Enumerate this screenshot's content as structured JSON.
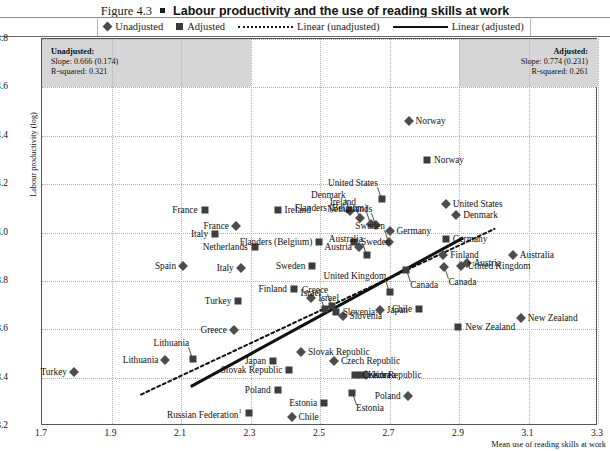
{
  "figure": {
    "number": "Figure 4.3",
    "bullet": "square-bullet",
    "title": "Labour productivity and the use of reading skills at work"
  },
  "legend": {
    "position": "top-center",
    "items": [
      {
        "marker": "diamond-marker",
        "label": "Unadjusted"
      },
      {
        "marker": "square-marker",
        "label": "Adjusted"
      },
      {
        "marker": "dotted-line",
        "label": "Linear (unadjusted)"
      },
      {
        "marker": "solid-line",
        "label": "Linear (adjusted)"
      }
    ]
  },
  "annotations": {
    "left": {
      "heading": "Unadjusted:",
      "slope": "Slope: 0.666 (0.174)",
      "r_squared": "R-squared: 0.321"
    },
    "right": {
      "heading": "Adjusted:",
      "slope": "Slope: 0.774 (0.231)",
      "r_squared": "R-squared: 0.261"
    }
  },
  "chart_data": {
    "type": "scatter",
    "title": "Labour productivity and the use of reading skills at work",
    "xlabel": "Mean use of reading skills at work",
    "ylabel": "Labour productivity (log)",
    "xlim": [
      1.7,
      3.3
    ],
    "ylim": [
      3.2,
      4.8
    ],
    "xticks": [
      "1.7",
      "1.9",
      "2.1",
      "2.3",
      "2.5",
      "2.7",
      "2.9",
      "3.1",
      "3.3"
    ],
    "yticks": [
      "3.2",
      "3.4",
      "3.6",
      "3.8",
      "4.0",
      "4.2",
      "4.4",
      "4.6",
      "4.8"
    ],
    "grid": true,
    "legend_position": "top",
    "footnote_marker": "1",
    "series": [
      {
        "name": "Unadjusted",
        "marker": "diamond",
        "points": [
          {
            "label": "Norway",
            "x": 2.755,
            "y": 4.462,
            "label_side": "right"
          },
          {
            "label": "Denmark",
            "x": 2.585,
            "y": 4.088,
            "label_side": "up"
          },
          {
            "label": "Ireland",
            "x": 2.615,
            "y": 4.06,
            "label_side": "up"
          },
          {
            "label": "Flanders (Belgium)",
            "x": 2.648,
            "y": 4.035,
            "label_side": "up"
          },
          {
            "label": "Netherlands",
            "x": 2.662,
            "y": 4.032,
            "label_side": "up"
          },
          {
            "label": "United States",
            "x": 2.862,
            "y": 4.118,
            "label_side": "right"
          },
          {
            "label": "Germany",
            "x": 2.7,
            "y": 4.005,
            "label_side": "right"
          },
          {
            "label": "Denmark",
            "x": 2.892,
            "y": 4.072,
            "label_side": "right"
          },
          {
            "label": "France",
            "x": 2.258,
            "y": 4.028,
            "label_side": "left"
          },
          {
            "label": "Spain",
            "x": 2.106,
            "y": 3.862,
            "label_side": "left"
          },
          {
            "label": "Italy",
            "x": 2.272,
            "y": 3.852,
            "label_side": "left"
          },
          {
            "label": "Sweden",
            "x": 2.698,
            "y": 3.962,
            "label_side": "up"
          },
          {
            "label": "Austria",
            "x": 2.612,
            "y": 3.938,
            "label_side": "left"
          },
          {
            "label": "Australia",
            "x": 3.055,
            "y": 3.905,
            "label_side": "right"
          },
          {
            "label": "Austria",
            "x": 2.922,
            "y": 3.875,
            "label_side": "right"
          },
          {
            "label": "Finland",
            "x": 2.855,
            "y": 3.905,
            "label_side": "right"
          },
          {
            "label": "United Kingdom",
            "x": 2.905,
            "y": 3.862,
            "label_side": "right"
          },
          {
            "label": "Canada",
            "x": 2.858,
            "y": 3.858,
            "label_side": "down"
          },
          {
            "label": "Israel",
            "x": 2.475,
            "y": 3.728,
            "label_side": "right"
          },
          {
            "label": "Japan",
            "x": 2.672,
            "y": 3.678,
            "label_side": "right"
          },
          {
            "label": "Slovenia",
            "x": 2.565,
            "y": 3.655,
            "label_side": "right"
          },
          {
            "label": "New Zealand",
            "x": 3.078,
            "y": 3.645,
            "label_side": "right"
          },
          {
            "label": "Greece",
            "x": 2.252,
            "y": 3.598,
            "label_side": "left"
          },
          {
            "label": "Lithuania",
            "x": 2.055,
            "y": 3.472,
            "label_side": "left"
          },
          {
            "label": "Turkey",
            "x": 1.792,
            "y": 3.425,
            "label_side": "left"
          },
          {
            "label": "Slovak Republic",
            "x": 2.445,
            "y": 3.505,
            "label_side": "right"
          },
          {
            "label": "Czech Republic",
            "x": 2.54,
            "y": 3.468,
            "label_side": "right"
          },
          {
            "label": "Korea",
            "x": 2.632,
            "y": 3.412,
            "label_side": "right"
          },
          {
            "label": "Poland",
            "x": 2.752,
            "y": 3.322,
            "label_side": "left"
          },
          {
            "label": "Chile",
            "x": 2.418,
            "y": 3.238,
            "label_side": "right"
          }
        ]
      },
      {
        "name": "Adjusted",
        "marker": "square",
        "points": [
          {
            "label": "Norway",
            "x": 2.808,
            "y": 4.298,
            "label_side": "right"
          },
          {
            "label": "United States",
            "x": 2.678,
            "y": 4.138,
            "label_side": "up"
          },
          {
            "label": "Ireland",
            "x": 2.378,
            "y": 4.092,
            "label_side": "right"
          },
          {
            "label": "France",
            "x": 2.168,
            "y": 4.092,
            "label_side": "left"
          },
          {
            "label": "Italy",
            "x": 2.198,
            "y": 3.995,
            "label_side": "left"
          },
          {
            "label": "Flanders (Belgium)",
            "x": 2.498,
            "y": 3.962,
            "label_side": "left"
          },
          {
            "label": "Sweden",
            "x": 2.598,
            "y": 3.962,
            "label_side": "right"
          },
          {
            "label": "Germany",
            "x": 2.862,
            "y": 3.975,
            "label_side": "right"
          },
          {
            "label": "Netherlands",
            "x": 2.312,
            "y": 3.942,
            "label_side": "left"
          },
          {
            "label": "Australia",
            "x": 2.635,
            "y": 3.905,
            "label_side": "up"
          },
          {
            "label": "Sweden",
            "x": 2.478,
            "y": 3.862,
            "label_side": "left"
          },
          {
            "label": "Canada",
            "x": 2.748,
            "y": 3.845,
            "label_side": "down"
          },
          {
            "label": "Finland",
            "x": 2.425,
            "y": 3.765,
            "label_side": "left"
          },
          {
            "label": "Turkey",
            "x": 2.265,
            "y": 3.718,
            "label_side": "left"
          },
          {
            "label": "Greece",
            "x": 2.535,
            "y": 3.695,
            "label_side": "up"
          },
          {
            "label": "Israel",
            "x": 2.515,
            "y": 3.682,
            "label_side": "up"
          },
          {
            "label": "Slovenia",
            "x": 2.545,
            "y": 3.672,
            "label_side": "right"
          },
          {
            "label": "United Kingdom",
            "x": 2.702,
            "y": 3.752,
            "label_side": "up"
          },
          {
            "label": "Chile",
            "x": 2.785,
            "y": 3.682,
            "label_side": "left"
          },
          {
            "label": "New Zealand",
            "x": 2.898,
            "y": 3.608,
            "label_side": "right"
          },
          {
            "label": "Lithuania",
            "x": 2.135,
            "y": 3.478,
            "label_side": "up"
          },
          {
            "label": "Japan",
            "x": 2.365,
            "y": 3.468,
            "label_side": "left"
          },
          {
            "label": "Slovak Republic",
            "x": 2.412,
            "y": 3.432,
            "label_side": "left"
          },
          {
            "label": "Czech Republic",
            "x": 2.602,
            "y": 3.412,
            "label_side": "right"
          },
          {
            "label": "Korea",
            "x": 2.618,
            "y": 3.412,
            "label_side": "right"
          },
          {
            "label": "Estonia",
            "x": 2.592,
            "y": 3.338,
            "label_side": "down"
          },
          {
            "label": "Poland",
            "x": 2.378,
            "y": 3.348,
            "label_side": "left"
          },
          {
            "label": "Estonia",
            "x": 2.512,
            "y": 3.295,
            "label_side": "left"
          },
          {
            "label": "Russian Federation",
            "x": 2.295,
            "y": 3.255,
            "label_side": "left"
          }
        ]
      }
    ],
    "trendlines": [
      {
        "name": "Linear (unadjusted)",
        "style": "dotted",
        "x1": 1.985,
        "y1": 3.33,
        "x2": 3.002,
        "y2": 4.015
      },
      {
        "name": "Linear (adjusted)",
        "style": "solid",
        "x1": 2.128,
        "y1": 3.363,
        "x2": 2.912,
        "y2": 3.978
      }
    ]
  }
}
